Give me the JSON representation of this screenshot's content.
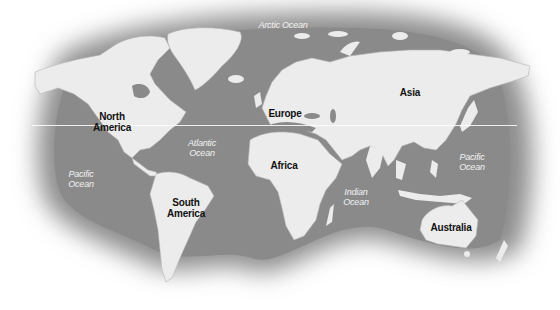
{
  "map": {
    "title": "World map",
    "colors": {
      "ocean": "#8c8c8c",
      "land": "#ececec",
      "border": "#b5b5b5",
      "background": "#ffffff",
      "continent_label": "#111111",
      "ocean_label": "#f2f2f2"
    },
    "continents": [
      {
        "id": "north-america",
        "label": "North\nAmerica",
        "x": 112,
        "y": 122
      },
      {
        "id": "south-america",
        "label": "South\nAmerica",
        "x": 186,
        "y": 208
      },
      {
        "id": "europe",
        "label": "Europe",
        "x": 285,
        "y": 113
      },
      {
        "id": "africa",
        "label": "Africa",
        "x": 284,
        "y": 165
      },
      {
        "id": "asia",
        "label": "Asia",
        "x": 410,
        "y": 92
      },
      {
        "id": "australia",
        "label": "Australia",
        "x": 451,
        "y": 227
      }
    ],
    "oceans": [
      {
        "id": "arctic-ocean",
        "label": "Arctic Ocean",
        "x": 283,
        "y": 25
      },
      {
        "id": "atlantic-ocean",
        "label": "Atlantic\nOcean",
        "x": 202,
        "y": 148
      },
      {
        "id": "pacific-ocean-west",
        "label": "Pacific\nOcean",
        "x": 81,
        "y": 179
      },
      {
        "id": "pacific-ocean-east",
        "label": "Pacific\nOcean",
        "x": 472,
        "y": 162
      },
      {
        "id": "indian-ocean",
        "label": "Indian\nOcean",
        "x": 356,
        "y": 197
      }
    ],
    "equator_line": true
  }
}
